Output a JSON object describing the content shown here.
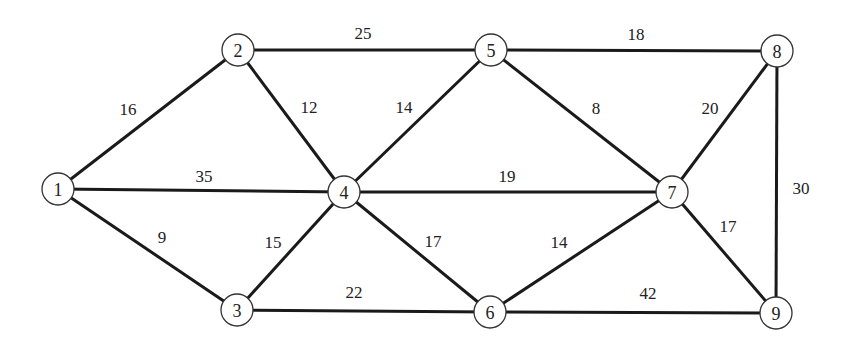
{
  "graph": {
    "nodes": [
      {
        "id": "1",
        "x": 58,
        "y": 189
      },
      {
        "id": "2",
        "x": 238,
        "y": 50
      },
      {
        "id": "3",
        "x": 237,
        "y": 310
      },
      {
        "id": "4",
        "x": 344,
        "y": 192
      },
      {
        "id": "5",
        "x": 491,
        "y": 50
      },
      {
        "id": "6",
        "x": 490,
        "y": 312
      },
      {
        "id": "7",
        "x": 672,
        "y": 192
      },
      {
        "id": "8",
        "x": 777,
        "y": 51
      },
      {
        "id": "9",
        "x": 776,
        "y": 313
      }
    ],
    "edges": [
      {
        "from": "1",
        "to": "2",
        "weight": "16",
        "lx": 128,
        "ly": 109
      },
      {
        "from": "1",
        "to": "4",
        "weight": "35",
        "lx": 204,
        "ly": 176
      },
      {
        "from": "1",
        "to": "3",
        "weight": "9",
        "lx": 162,
        "ly": 237
      },
      {
        "from": "2",
        "to": "5",
        "weight": "25",
        "lx": 363,
        "ly": 33
      },
      {
        "from": "2",
        "to": "4",
        "weight": "12",
        "lx": 309,
        "ly": 107
      },
      {
        "from": "5",
        "to": "4",
        "weight": "14",
        "lx": 404,
        "ly": 107
      },
      {
        "from": "5",
        "to": "8",
        "weight": "18",
        "lx": 636,
        "ly": 34
      },
      {
        "from": "5",
        "to": "7",
        "weight": "8",
        "lx": 596,
        "ly": 108
      },
      {
        "from": "8",
        "to": "7",
        "weight": "20",
        "lx": 710,
        "ly": 108
      },
      {
        "from": "8",
        "to": "9",
        "weight": "30",
        "lx": 801,
        "ly": 188
      },
      {
        "from": "4",
        "to": "7",
        "weight": "19",
        "lx": 507,
        "ly": 176
      },
      {
        "from": "4",
        "to": "3",
        "weight": "15",
        "lx": 273,
        "ly": 242
      },
      {
        "from": "4",
        "to": "6",
        "weight": "17",
        "lx": 433,
        "ly": 241
      },
      {
        "from": "7",
        "to": "6",
        "weight": "14",
        "lx": 559,
        "ly": 242
      },
      {
        "from": "7",
        "to": "9",
        "weight": "17",
        "lx": 728,
        "ly": 226
      },
      {
        "from": "3",
        "to": "6",
        "weight": "22",
        "lx": 354,
        "ly": 292
      },
      {
        "from": "6",
        "to": "9",
        "weight": "42",
        "lx": 648,
        "ly": 293
      }
    ]
  },
  "style": {
    "edge_color": "#1a1a1a",
    "node_fill": "#ffffff",
    "node_stroke": "#333333",
    "node_radius": 16
  }
}
